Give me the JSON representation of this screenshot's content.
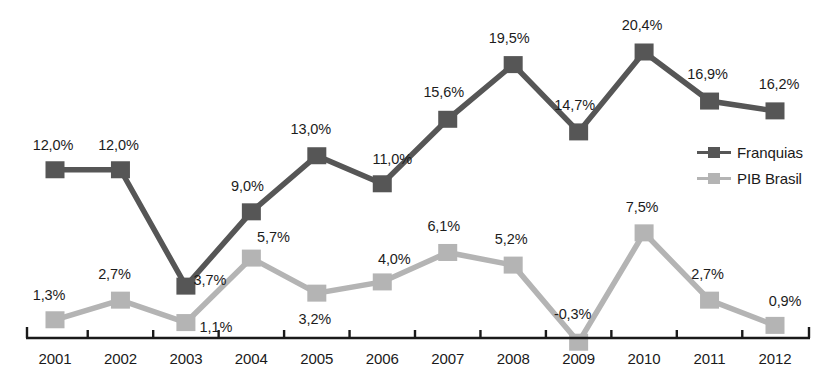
{
  "chart_data": {
    "type": "line",
    "title": "",
    "subtitle": "",
    "xlabel": "",
    "ylabel": "",
    "grid": false,
    "legend_position": "right-middle",
    "axis": {
      "x_axis_visible": true,
      "y_axis_visible": false,
      "ticks_visible": true,
      "ylim": [
        -0.3,
        20.4
      ]
    },
    "categories": [
      "2001",
      "2002",
      "2003",
      "2004",
      "2005",
      "2006",
      "2007",
      "2008",
      "2009",
      "2010",
      "2011",
      "2012"
    ],
    "series": [
      {
        "name": "Franquias",
        "color": "#565656",
        "marker": "square",
        "values": [
          12.0,
          12.0,
          3.7,
          9.0,
          13.0,
          11.0,
          15.6,
          19.5,
          14.7,
          20.4,
          16.9,
          16.2
        ],
        "labels": [
          "12,0%",
          "12,0%",
          "3,7%",
          "9,0%",
          "13,0%",
          "11,0%",
          "15,6%",
          "19,5%",
          "14,7%",
          "20,4%",
          "16,9%",
          "16,2%"
        ]
      },
      {
        "name": "PIB Brasil",
        "color": "#b4b4b4",
        "marker": "square",
        "values": [
          1.3,
          2.7,
          1.1,
          5.7,
          3.2,
          4.0,
          6.1,
          5.2,
          -0.3,
          7.5,
          2.7,
          0.9
        ],
        "labels": [
          "1,3%",
          "2,7%",
          "1,1%",
          "5,7%",
          "3,2%",
          "4,0%",
          "6,1%",
          "5,2%",
          "-0,3%",
          "7,5%",
          "2,7%",
          "0,9%"
        ]
      }
    ]
  },
  "legend": {
    "items": [
      {
        "label": "Franquias",
        "color": "#565656"
      },
      {
        "label": "PIB Brasil",
        "color": "#b4b4b4"
      }
    ]
  },
  "colors": {
    "franquias": "#565656",
    "pib_brasil": "#b4b4b4",
    "axis": "#1a1a1a",
    "text": "#1a1a1a",
    "background": "#ffffff"
  }
}
